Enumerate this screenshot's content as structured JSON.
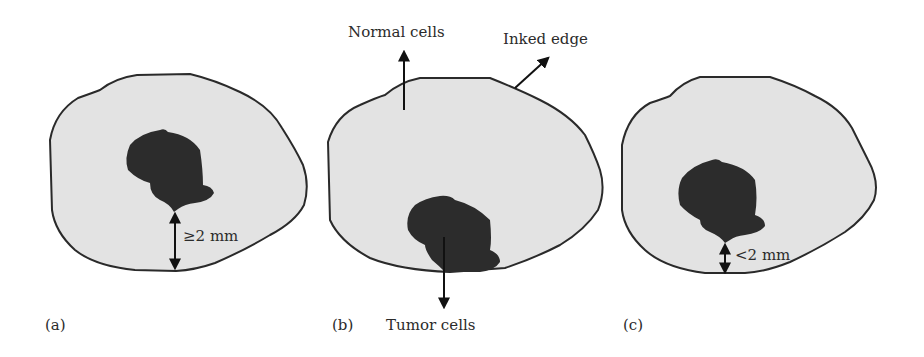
{
  "figure": {
    "colors": {
      "tissue_fill": "#e3e3e3",
      "tissue_stroke": "#2a2a2a",
      "tumor_fill": "#2c2c2c",
      "arrow": "#111111",
      "text": "#2b2b2b",
      "background": "#ffffff"
    },
    "panels": [
      {
        "id": "a",
        "label": "(a)",
        "margin_label": "≥2 mm",
        "description": "Tumor with negative margin, distance to inked edge at least 2 mm"
      },
      {
        "id": "b",
        "label": "(b)",
        "annotations": {
          "normal_cells": "Normal cells",
          "inked_edge": "Inked edge",
          "tumor_cells": "Tumor cells"
        },
        "description": "Tumor reaching inked edge (positive margin)"
      },
      {
        "id": "c",
        "label": "(c)",
        "margin_label": "<2 mm",
        "description": "Tumor close to inked edge, distance less than 2 mm"
      }
    ]
  }
}
